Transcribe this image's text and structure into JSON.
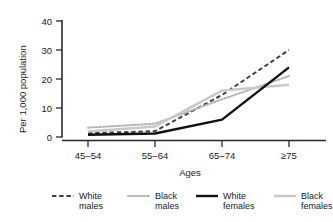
{
  "chart_data": {
    "type": "line",
    "title": "",
    "xlabel": "Ages",
    "ylabel": "Per 1,000 population",
    "categories": [
      "45–54",
      "55–64",
      "65–74",
      "≥75"
    ],
    "ylim": [
      0,
      40
    ],
    "yticks": [
      0,
      10,
      20,
      30,
      40
    ],
    "ytick_labels": [
      "0",
      "10",
      "20",
      "30",
      "40"
    ],
    "grid": false,
    "legend_position": "bottom",
    "series": [
      {
        "name": "White males",
        "label_line1": "White",
        "label_line2": "males",
        "values": [
          1.3,
          2.0,
          14.5,
          30.0
        ],
        "color": "#3f3f3f",
        "style": "dashed",
        "width": 2.0
      },
      {
        "name": "Black males",
        "label_line1": "Black",
        "label_line2": "males",
        "values": [
          3.2,
          4.6,
          13.0,
          21.0
        ],
        "color": "#b5b5b5",
        "style": "dotted",
        "width": 2.0
      },
      {
        "name": "White females",
        "label_line1": "White",
        "label_line2": "females",
        "values": [
          0.8,
          1.2,
          6.0,
          24.0
        ],
        "color": "#111111",
        "style": "solid",
        "width": 2.4
      },
      {
        "name": "Black females",
        "label_line1": "Black",
        "label_line2": "females",
        "values": [
          1.9,
          3.6,
          16.0,
          18.0
        ],
        "color": "#c8c8c8",
        "style": "solid",
        "width": 2.4
      }
    ]
  },
  "axes": {
    "y_label": "Per 1,000 population",
    "x_label": "Ages",
    "y_ticks": [
      "40",
      "30",
      "20",
      "10",
      "0"
    ],
    "x_ticks": [
      "45–54",
      "55–64",
      "65–74",
      "≥75"
    ]
  },
  "legend": {
    "items": [
      {
        "line1": "White",
        "line2": "males",
        "swatch": "dashed-dark"
      },
      {
        "line1": "Black",
        "line2": "males",
        "swatch": "dotted-light"
      },
      {
        "line1": "White",
        "line2": "females",
        "swatch": "solid-black"
      },
      {
        "line1": "Black",
        "line2": "females",
        "swatch": "solid-lightgray"
      }
    ]
  },
  "colors": {
    "axis": "#2b2b2b",
    "white_males": "#3f3f3f",
    "black_males": "#b5b5b5",
    "white_females": "#111111",
    "black_females": "#c8c8c8",
    "background": "#ffffff"
  }
}
